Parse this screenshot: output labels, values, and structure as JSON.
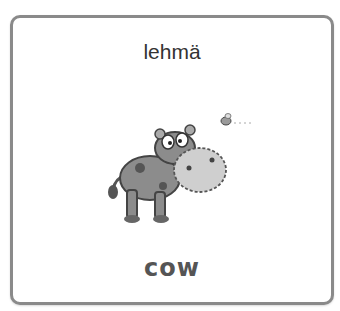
{
  "card": {
    "word_finnish": "lehmä",
    "word_english": "cow",
    "image_icon": "cow-illustration",
    "border_color": "#8a8a8a"
  }
}
